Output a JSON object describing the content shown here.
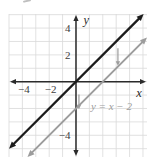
{
  "figure": {
    "background": "#ffffff",
    "description_colors": {
      "primary_line": "#1c1c1c",
      "secondary_line": "#9c9c9c",
      "grid": "#d9d9d9",
      "axis": "#2b2b2b",
      "tick_labels": "#3d3d3d"
    }
  },
  "chart_data": {
    "type": "line",
    "title": "",
    "xlabel": "x",
    "ylabel": "y",
    "xlim": [
      -5.0,
      5.3
    ],
    "ylim": [
      -5.62,
      5.05
    ],
    "grid": true,
    "grid_color": "#d9d9d9",
    "axis_color": "#2b2b2b",
    "tick_label_color": "#3d3d3d",
    "x_ticks": [
      {
        "value": -4,
        "label": "−4"
      },
      {
        "value": -2,
        "label": "−2"
      }
    ],
    "y_ticks": [
      {
        "value": 4,
        "label": "4"
      },
      {
        "value": 2,
        "label": "2"
      },
      {
        "value": -4,
        "label": "−4"
      }
    ],
    "series": [
      {
        "name": "y = x",
        "slope": 1,
        "intercept": 0,
        "color": "#1c1c1c",
        "width": 2.3,
        "arrows": "both"
      },
      {
        "name": "y = x − 2",
        "slope": 1,
        "intercept": -2,
        "color": "#9c9c9c",
        "width": 1.9,
        "arrows": "both"
      }
    ],
    "series_label": {
      "text": "y = x − 2",
      "x": 2.65,
      "y": -1.81,
      "color": "#9c9c9c"
    },
    "annotations": [
      {
        "type": "down-arrow",
        "x": 3.13,
        "y_from": 2.5,
        "y_to": 1.18,
        "color": "#9c9c9c"
      },
      {
        "type": "down-arrow",
        "x": 0.22,
        "y_from": -0.95,
        "y_to": -2.05,
        "color": "#9c9c9c"
      }
    ]
  }
}
